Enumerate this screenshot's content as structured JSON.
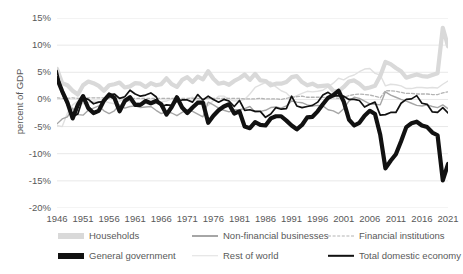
{
  "chart_data": {
    "type": "line",
    "title": "",
    "xlabel": "",
    "ylabel": "percent of GDP",
    "ylim": [
      -20,
      15
    ],
    "xlim": [
      1946,
      2021
    ],
    "grid": true,
    "legend_position": "bottom",
    "ytick_labels": [
      "15%",
      "10%",
      "5%",
      "0%",
      "-5%",
      "-10%",
      "-15%",
      "-20%"
    ],
    "ytick_values": [
      15,
      10,
      5,
      0,
      -5,
      -10,
      -15,
      -20
    ],
    "xtick_labels": [
      "1946",
      "1951",
      "1956",
      "1961",
      "1966",
      "1971",
      "1976",
      "1981",
      "1986",
      "1991",
      "1996",
      "2001",
      "2006",
      "2011",
      "2016",
      "2021"
    ],
    "xtick_values": [
      1946,
      1951,
      1956,
      1961,
      1966,
      1971,
      1976,
      1981,
      1986,
      1991,
      1996,
      2001,
      2006,
      2011,
      2016,
      2021
    ],
    "x": [
      1946,
      1947,
      1948,
      1949,
      1950,
      1951,
      1952,
      1953,
      1954,
      1955,
      1956,
      1957,
      1958,
      1959,
      1960,
      1961,
      1962,
      1963,
      1964,
      1965,
      1966,
      1967,
      1968,
      1969,
      1970,
      1971,
      1972,
      1973,
      1974,
      1975,
      1976,
      1977,
      1978,
      1979,
      1980,
      1981,
      1982,
      1983,
      1984,
      1985,
      1986,
      1987,
      1988,
      1989,
      1990,
      1991,
      1992,
      1993,
      1994,
      1995,
      1996,
      1997,
      1998,
      1999,
      2000,
      2001,
      2002,
      2003,
      2004,
      2005,
      2006,
      2007,
      2008,
      2009,
      2010,
      2011,
      2012,
      2013,
      2014,
      2015,
      2016,
      2017,
      2018,
      2019,
      2020,
      2021
    ],
    "series": [
      {
        "name": "Households",
        "color": "#d9d9d9",
        "width": 4.2,
        "dash": "",
        "values": [
          5.6,
          3.0,
          2.6,
          1.6,
          0.9,
          2.6,
          3.3,
          3.0,
          2.5,
          1.6,
          2.6,
          2.8,
          3.1,
          2.2,
          2.4,
          3.0,
          2.9,
          2.3,
          3.0,
          2.6,
          2.8,
          3.9,
          2.8,
          2.3,
          3.6,
          4.1,
          3.2,
          4.2,
          3.7,
          5.2,
          3.8,
          2.9,
          3.1,
          2.7,
          3.4,
          3.9,
          4.6,
          3.6,
          4.7,
          3.5,
          3.4,
          2.6,
          2.9,
          2.9,
          3.2,
          4.1,
          4.3,
          3.2,
          2.6,
          2.9,
          2.4,
          2.5,
          2.6,
          1.6,
          1.5,
          2.3,
          3.3,
          3.5,
          2.9,
          2.0,
          2.2,
          2.5,
          4.3,
          6.9,
          6.5,
          5.8,
          5.2,
          4.0,
          4.3,
          4.6,
          4.3,
          4.2,
          4.5,
          4.8,
          13.2,
          9.8
        ]
      },
      {
        "name": "General government",
        "color": "#111111",
        "width": 4.2,
        "dash": "",
        "values": [
          3.9,
          1.5,
          -0.6,
          -3.5,
          -1.0,
          0.6,
          -1.6,
          -2.5,
          -2.1,
          -0.2,
          0.9,
          0.3,
          -2.2,
          -0.3,
          0.4,
          -1.0,
          -1.0,
          -0.3,
          -0.7,
          -0.3,
          -0.9,
          -2.8,
          -1.4,
          0.4,
          -1.5,
          -2.5,
          -1.5,
          -0.6,
          -0.6,
          -4.3,
          -3.0,
          -2.0,
          -1.3,
          -0.9,
          -2.6,
          -2.2,
          -5.0,
          -5.3,
          -4.2,
          -4.7,
          -4.8,
          -3.5,
          -3.1,
          -3.1,
          -3.9,
          -4.8,
          -5.5,
          -4.7,
          -3.3,
          -3.2,
          -2.2,
          -0.9,
          0.3,
          0.8,
          1.6,
          -0.4,
          -3.7,
          -4.8,
          -4.3,
          -3.0,
          -2.1,
          -2.7,
          -6.5,
          -12.7,
          -11.3,
          -10.1,
          -7.7,
          -5.1,
          -4.4,
          -4.1,
          -4.8,
          -5.1,
          -6.1,
          -6.6,
          -14.9,
          -11.9
        ]
      },
      {
        "name": "Non-financial businesses",
        "color": "#a6a6a6",
        "width": 1.4,
        "dash": "",
        "values": [
          -4.5,
          -3.6,
          -3.2,
          -1.6,
          -2.8,
          -2.9,
          -2.0,
          -1.6,
          -1.2,
          -2.1,
          -2.6,
          -2.1,
          -1.0,
          -1.6,
          -1.3,
          -1.2,
          -1.5,
          -1.4,
          -1.3,
          -2.0,
          -2.6,
          -2.3,
          -2.5,
          -3.0,
          -2.4,
          -1.9,
          -2.2,
          -2.7,
          -3.2,
          -0.5,
          -1.0,
          -1.6,
          -2.0,
          -2.3,
          -1.9,
          -1.9,
          -1.7,
          -1.3,
          -2.3,
          -2.2,
          -2.0,
          -1.5,
          -1.4,
          -1.6,
          -1.2,
          -0.3,
          -0.5,
          -0.6,
          -1.0,
          -1.2,
          -1.1,
          -1.2,
          -1.9,
          -2.1,
          -2.6,
          -1.7,
          -0.3,
          0.4,
          0.2,
          -0.3,
          -0.8,
          -0.9,
          -1.0,
          1.4,
          0.8,
          0.4,
          0.0,
          -0.3,
          -0.7,
          -1.1,
          -1.2,
          -1.0,
          -1.3,
          -1.5,
          -1.0,
          -1.7
        ]
      },
      {
        "name": "Rest of world",
        "color": "#e0e0e0",
        "width": 1.4,
        "dash": "",
        "values": [
          -4.8,
          -5.0,
          -2.5,
          -1.0,
          -0.3,
          -0.8,
          -0.6,
          -0.3,
          -0.4,
          -0.3,
          -0.6,
          -0.8,
          -0.3,
          0.2,
          -0.5,
          -0.6,
          -0.6,
          -0.7,
          -1.0,
          -0.7,
          -0.4,
          -0.3,
          0.1,
          0.1,
          -0.2,
          0.1,
          0.4,
          -0.4,
          -0.2,
          -1.1,
          -0.2,
          0.6,
          0.6,
          0.0,
          -0.3,
          -0.2,
          0.0,
          1.0,
          2.2,
          2.7,
          3.1,
          3.2,
          2.3,
          1.6,
          1.2,
          0.2,
          0.7,
          1.1,
          1.5,
          1.4,
          1.5,
          1.7,
          2.3,
          3.0,
          3.9,
          3.6,
          4.2,
          4.5,
          5.1,
          5.6,
          5.7,
          4.8,
          4.5,
          2.5,
          2.8,
          2.7,
          2.5,
          2.0,
          2.0,
          2.2,
          2.2,
          2.1,
          2.2,
          2.1,
          2.8,
          3.4
        ]
      },
      {
        "name": "Financial institutions",
        "color": "#b3b3b3",
        "width": 1.3,
        "dash": "3 2",
        "values": [
          0.3,
          0.2,
          0.2,
          0.3,
          0.2,
          0.2,
          0.3,
          0.3,
          0.3,
          0.3,
          0.2,
          0.2,
          0.3,
          0.2,
          0.2,
          0.2,
          0.2,
          0.2,
          0.2,
          0.2,
          0.2,
          0.2,
          0.2,
          0.2,
          0.2,
          0.2,
          0.2,
          0.2,
          0.1,
          0.2,
          0.2,
          0.2,
          0.2,
          0.2,
          0.2,
          0.2,
          0.1,
          0.1,
          0.1,
          0.2,
          0.1,
          0.1,
          0.1,
          0.0,
          0.2,
          0.4,
          0.5,
          0.6,
          0.4,
          0.4,
          0.4,
          0.4,
          0.3,
          0.3,
          0.2,
          0.4,
          0.7,
          0.9,
          1.0,
          0.9,
          0.8,
          0.6,
          0.3,
          1.6,
          1.6,
          1.5,
          1.3,
          1.1,
          1.1,
          1.0,
          1.0,
          1.0,
          0.9,
          0.9,
          1.2,
          1.4
        ]
      },
      {
        "name": "Total domestic economy",
        "color": "#111111",
        "width": 1.7,
        "dash": "",
        "values": [
          5.3,
          1.1,
          -1.0,
          -3.2,
          -2.7,
          0.3,
          0.0,
          -0.8,
          -0.5,
          -0.4,
          0.9,
          1.0,
          0.2,
          0.5,
          1.7,
          1.0,
          0.6,
          0.8,
          1.2,
          0.5,
          -1.3,
          -1.0,
          -1.1,
          -0.3,
          -0.1,
          -0.1,
          -0.5,
          0.9,
          -0.1,
          0.6,
          0.0,
          -0.5,
          0.0,
          -0.3,
          -1.3,
          -0.2,
          -2.0,
          -1.9,
          -2.2,
          -2.2,
          -3.3,
          -2.7,
          -1.5,
          -1.8,
          -1.7,
          0.6,
          -1.2,
          -1.5,
          -1.3,
          -1.1,
          -0.5,
          0.8,
          1.3,
          0.6,
          0.7,
          0.6,
          0.0,
          0.0,
          -0.2,
          -1.4,
          -0.9,
          -0.5,
          -2.9,
          -2.8,
          -2.4,
          -2.4,
          -0.7,
          0.0,
          0.1,
          0.7,
          -0.7,
          -0.9,
          -2.3,
          -2.4,
          -1.5,
          -2.5
        ]
      }
    ]
  },
  "legend": {
    "items": [
      {
        "label": "Households",
        "key": "households"
      },
      {
        "label": "Non-financial businesses",
        "key": "nfb"
      },
      {
        "label": "Financial institutions",
        "key": "fin"
      },
      {
        "label": "General government",
        "key": "govt"
      },
      {
        "label": "Rest of world",
        "key": "row"
      },
      {
        "label": "Total domestic economy",
        "key": "total"
      }
    ]
  }
}
